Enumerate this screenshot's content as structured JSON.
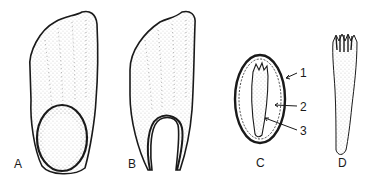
{
  "figure": {
    "panels": [
      {
        "id": "A",
        "label": "A",
        "description": "seed with intact oval embryo region at base"
      },
      {
        "id": "B",
        "label": "B",
        "description": "seed with open U-shaped base"
      },
      {
        "id": "C",
        "label": "C",
        "description": "cross-section with numbered parts",
        "callouts": [
          {
            "label": "1"
          },
          {
            "label": "2"
          },
          {
            "label": "3"
          }
        ]
      },
      {
        "id": "D",
        "label": "D",
        "description": "elongated embryo with fringed tip"
      }
    ],
    "colors": {
      "ink": "#1a1a1a",
      "background": "#ffffff"
    }
  }
}
